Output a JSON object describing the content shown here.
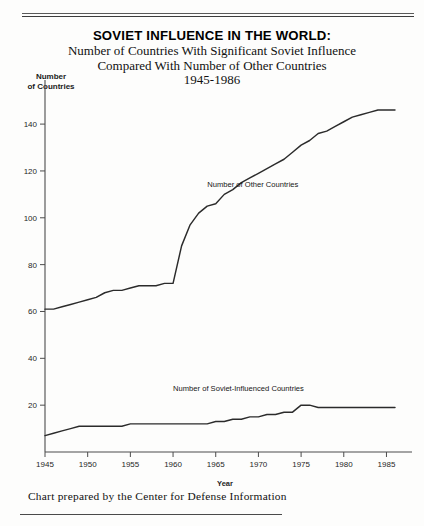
{
  "title": {
    "line1": "SOVIET INFLUENCE IN THE WORLD:",
    "line2": "Number of Countries With Significant Soviet Influence",
    "line3": "Compared With Number of Other Countries",
    "line4": "1945-1986"
  },
  "axis": {
    "y_caption_line1": "Number",
    "y_caption_line2": "of Countries",
    "x_caption": "Year"
  },
  "footer": {
    "credit": "Chart prepared by the Center for Defense Information"
  },
  "colors": {
    "line": "#2b2b2b",
    "axis": "#4c4c4c",
    "background": "#fdfdfc",
    "text": "#111111"
  },
  "chart_data": {
    "type": "line",
    "title": "SOVIET INFLUENCE IN THE WORLD: Number of Countries With Significant Soviet Influence Compared With Number of Other Countries 1945-1986",
    "xlabel": "Year",
    "ylabel": "Number of Countries",
    "xlim": [
      1945,
      1986
    ],
    "ylim": [
      0,
      152
    ],
    "xticks": [
      1945,
      1950,
      1955,
      1960,
      1965,
      1970,
      1975,
      1980,
      1985
    ],
    "yticks": [
      20,
      40,
      60,
      80,
      100,
      120,
      140
    ],
    "grid": false,
    "legend": "inline-annotation",
    "series": [
      {
        "name": "Number of Other Countries",
        "label_position": {
          "x": 1964,
          "y": 113
        },
        "x": [
          1945,
          1946,
          1947,
          1948,
          1949,
          1950,
          1951,
          1952,
          1953,
          1954,
          1955,
          1956,
          1957,
          1958,
          1959,
          1960,
          1961,
          1962,
          1963,
          1964,
          1965,
          1966,
          1967,
          1968,
          1969,
          1970,
          1971,
          1972,
          1973,
          1974,
          1975,
          1976,
          1977,
          1978,
          1979,
          1980,
          1981,
          1982,
          1983,
          1984,
          1985,
          1986
        ],
        "values": [
          61,
          61,
          62,
          63,
          64,
          65,
          66,
          68,
          69,
          69,
          70,
          71,
          71,
          71,
          72,
          72,
          88,
          97,
          102,
          105,
          106,
          110,
          112,
          115,
          117,
          119,
          121,
          123,
          125,
          128,
          131,
          133,
          136,
          137,
          139,
          141,
          143,
          144,
          145,
          146,
          146,
          146
        ]
      },
      {
        "name": "Number of Soviet-Influenced Countries",
        "label_position": {
          "x": 1960,
          "y": 26
        },
        "x": [
          1945,
          1946,
          1947,
          1948,
          1949,
          1950,
          1951,
          1952,
          1953,
          1954,
          1955,
          1956,
          1957,
          1958,
          1959,
          1960,
          1961,
          1962,
          1963,
          1964,
          1965,
          1966,
          1967,
          1968,
          1969,
          1970,
          1971,
          1972,
          1973,
          1974,
          1975,
          1976,
          1977,
          1978,
          1979,
          1980,
          1981,
          1982,
          1983,
          1984,
          1985,
          1986
        ],
        "values": [
          7,
          8,
          9,
          10,
          11,
          11,
          11,
          11,
          11,
          11,
          12,
          12,
          12,
          12,
          12,
          12,
          12,
          12,
          12,
          12,
          13,
          13,
          14,
          14,
          15,
          15,
          16,
          16,
          17,
          17,
          20,
          20,
          19,
          19,
          19,
          19,
          19,
          19,
          19,
          19,
          19,
          19
        ]
      }
    ]
  }
}
